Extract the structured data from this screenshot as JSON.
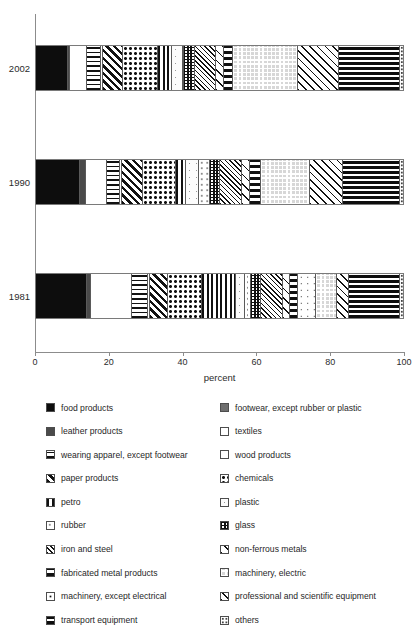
{
  "chart_data": {
    "type": "bar",
    "orientation": "horizontal",
    "stacked": true,
    "title": "",
    "xlabel": "percent",
    "ylabel": "",
    "xlim": [
      0,
      100
    ],
    "xticks": [
      0,
      20,
      40,
      60,
      80,
      100
    ],
    "xtick_labels": [
      "0",
      "20",
      "40",
      "60",
      "80",
      "100"
    ],
    "categories": [
      "2002",
      "1990",
      "1981"
    ],
    "grid": false,
    "legend_position": "below",
    "series": [
      {
        "name": "food products",
        "pattern": "solid-black",
        "values": [
          7.6,
          10.8,
          12.7
        ]
      },
      {
        "name": "footwear, except rubber or plastic",
        "pattern": "solid-grey",
        "values": [
          0.0,
          0.0,
          0.0
        ]
      },
      {
        "name": "leather products",
        "pattern": "solid-dark-grey",
        "values": [
          0.5,
          1.5,
          1.0
        ]
      },
      {
        "name": "textiles",
        "pattern": "white",
        "values": [
          4.0,
          5.2,
          10.0
        ]
      },
      {
        "name": "wearing apparel, except footwear",
        "pattern": "horizontal-lines",
        "values": [
          3.2,
          3.1,
          4.1
        ]
      },
      {
        "name": "wood products",
        "pattern": "light-dots",
        "values": [
          0.6,
          0.6,
          0.5
        ]
      },
      {
        "name": "paper products",
        "pattern": "diagonal-hatch",
        "values": [
          4.6,
          5.0,
          4.3
        ]
      },
      {
        "name": "chemicals",
        "pattern": "dense-dots",
        "values": [
          8.3,
          8.1,
          8.6
        ]
      },
      {
        "name": "petro",
        "pattern": "vertical-lines",
        "values": [
          3.3,
          2.6,
          8.2
        ]
      },
      {
        "name": "plastic",
        "pattern": "speckle-light",
        "values": [
          2.5,
          3.1,
          2.2
        ]
      },
      {
        "name": "rubber",
        "pattern": "sparse-dots",
        "values": [
          0.4,
          2.6,
          1.6
        ]
      },
      {
        "name": "glass",
        "pattern": "block-grid",
        "values": [
          2.6,
          2.5,
          2.5
        ]
      },
      {
        "name": "iron and steel",
        "pattern": "mesh-zigzag",
        "values": [
          5.0,
          5.5,
          5.5
        ]
      },
      {
        "name": "non-ferrous metals",
        "pattern": "large-cross-hatch",
        "values": [
          1.7,
          1.9,
          1.7
        ]
      },
      {
        "name": "fabricated metal products",
        "pattern": "dashed-vertical",
        "values": [
          2.3,
          2.6,
          2.0
        ]
      },
      {
        "name": "machinery, except electrical",
        "pattern": "fine-dots",
        "values": [
          0.0,
          0.0,
          4.5
        ]
      },
      {
        "name": "machinery, electric",
        "pattern": "light-grid",
        "values": [
          15.3,
          12.2,
          5.1
        ]
      },
      {
        "name": "professional and scientific equipment",
        "pattern": "cross-hatch-med",
        "values": [
          9.6,
          8.0,
          3.0
        ]
      },
      {
        "name": "transport equipment",
        "pattern": "bold-horizontal",
        "values": [
          14.5,
          14.0,
          12.5
        ]
      },
      {
        "name": "others",
        "pattern": "speckle-box",
        "values": [
          0.6,
          0.7,
          0.8
        ]
      }
    ]
  },
  "axis": {
    "x_title": "percent",
    "ticks": [
      "0",
      "20",
      "40",
      "60",
      "80",
      "100"
    ],
    "year_labels": [
      "2002",
      "1990",
      "1981"
    ]
  },
  "legend": {
    "left_column": [
      {
        "label": "food products",
        "swatch": "p-food"
      },
      {
        "label": "leather products",
        "swatch": "p-leather"
      },
      {
        "label": "wearing apparel, except footwear",
        "swatch": "p-apparel"
      },
      {
        "label": "paper products",
        "swatch": "p-paper"
      },
      {
        "label": "petro",
        "swatch": "p-petro"
      },
      {
        "label": "rubber",
        "swatch": "p-rubber"
      },
      {
        "label": "iron and steel",
        "swatch": "p-iron"
      },
      {
        "label": "fabricated metal products",
        "swatch": "p-fabricated"
      },
      {
        "label": "machinery, except electrical",
        "swatch": "p-mach-nonelec"
      },
      {
        "label": "transport equipment",
        "swatch": "p-transport"
      }
    ],
    "right_column": [
      {
        "label": "footwear, except rubber or plastic",
        "swatch": "p-footwear"
      },
      {
        "label": "textiles",
        "swatch": "p-textiles"
      },
      {
        "label": "wood products",
        "swatch": "p-wood"
      },
      {
        "label": "chemicals",
        "swatch": "p-chemicals"
      },
      {
        "label": "plastic",
        "swatch": "p-plastic"
      },
      {
        "label": "glass",
        "swatch": "p-glass"
      },
      {
        "label": "non-ferrous metals",
        "swatch": "p-nonferrous"
      },
      {
        "label": "machinery, electric",
        "swatch": "p-mach-elec"
      },
      {
        "label": "professional and scientific equipment",
        "swatch": "p-prof"
      },
      {
        "label": "others",
        "swatch": "p-others"
      }
    ]
  },
  "colors": {
    "ink": "#111111",
    "axis": "#8c8c8c",
    "bar_border": "#7a7a7a"
  }
}
